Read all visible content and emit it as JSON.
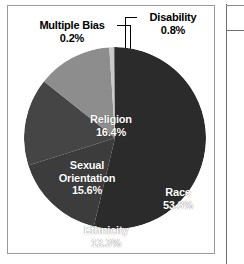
{
  "chart_data": {
    "type": "pie",
    "title": "",
    "categories": [
      "Race",
      "Religion",
      "Sexual Orientation",
      "Ethnicity",
      "Disability",
      "Multiple Bias"
    ],
    "values": [
      53.8,
      16.4,
      15.6,
      13.3,
      0.8,
      0.2
    ],
    "unit": "%",
    "legend": "none",
    "labels_inside": [
      "Race",
      "Religion",
      "Sexual Orientation",
      "Ethnicity"
    ],
    "labels_callout": [
      "Multiple Bias",
      "Disability"
    ],
    "slice_colors": [
      "#2b2b2b",
      "#3c3c3c",
      "#454545",
      "#8d8d8d",
      "#c9c9c9",
      "#6a6a6a"
    ],
    "start_angle_deg": 0,
    "direction": "clockwise"
  },
  "chart": {
    "slices": [
      {
        "name": "Race",
        "label": "Race",
        "pct": "53.8%",
        "value": 53.8,
        "color": "#2b2b2b"
      },
      {
        "name": "Religion",
        "label": "Religion",
        "pct": "16.4%",
        "value": 16.4,
        "color": "#3c3c3c"
      },
      {
        "name": "Sexual Orientation",
        "label_line1": "Sexual",
        "label_line2": "Orientation",
        "pct": "15.6%",
        "value": 15.6,
        "color": "#454545"
      },
      {
        "name": "Ethnicity",
        "label": "Ethnicity",
        "pct": "13.3%",
        "value": 13.3,
        "color": "#8d8d8d"
      },
      {
        "name": "Disability",
        "label": "Disability",
        "pct": "0.8%",
        "value": 0.8,
        "color": "#c9c9c9"
      },
      {
        "name": "Multiple Bias",
        "label": "Multiple Bias",
        "pct": "0.2%",
        "value": 0.2,
        "color": "#6a6a6a"
      }
    ]
  }
}
